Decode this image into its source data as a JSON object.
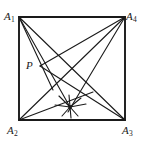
{
  "figure": {
    "kind": "geometry-diagram",
    "stroke_color": "#1a1a1a",
    "background_color": "#ffffff",
    "square_stroke_width": 1.9,
    "line_stroke_width": 1.1,
    "labels": {
      "a1": "A",
      "a1_sub": "1",
      "a2": "A",
      "a2_sub": "2",
      "a3": "A",
      "a3_sub": "3",
      "a4": "A",
      "a4_sub": "4",
      "p": "P"
    },
    "points": {
      "A1": {
        "x": 19,
        "y": 17,
        "name": "A1"
      },
      "A2": {
        "x": 19,
        "y": 120,
        "name": "A2"
      },
      "A3": {
        "x": 125,
        "y": 120,
        "name": "A3"
      },
      "A4": {
        "x": 125,
        "y": 17,
        "name": "A4"
      },
      "P": {
        "x": 40,
        "y": 66,
        "name": "P"
      },
      "S": {
        "x": 70,
        "y": 107,
        "name": "starburst-center"
      },
      "Q": {
        "x": 62,
        "y": 80,
        "name": "upper-crossing"
      }
    },
    "square_path": "M19,17 L125,17 L125,120 L19,120 Z",
    "segments": [
      {
        "name": "segment-A1-S",
        "x1": 19,
        "y1": 17,
        "x2": 70,
        "y2": 107
      },
      {
        "name": "segment-A1-A3",
        "x1": 19,
        "y1": 17,
        "x2": 125,
        "y2": 120
      },
      {
        "name": "segment-A1-P-ext",
        "x1": 19,
        "y1": 17,
        "x2": 53,
        "y2": 90
      },
      {
        "name": "segment-P-A4",
        "x1": 40,
        "y1": 66,
        "x2": 125,
        "y2": 17
      },
      {
        "name": "segment-P-A3",
        "x1": 40,
        "y1": 66,
        "x2": 125,
        "y2": 120
      },
      {
        "name": "segment-A4-A2",
        "x1": 125,
        "y1": 17,
        "x2": 19,
        "y2": 120
      },
      {
        "name": "segment-A4-S",
        "x1": 125,
        "y1": 17,
        "x2": 68,
        "y2": 112
      },
      {
        "name": "segment-A2-S-A3",
        "x1": 19,
        "y1": 120,
        "x2": 125,
        "y2": 120
      },
      {
        "name": "segment-A2-Q",
        "x1": 19,
        "y1": 120,
        "x2": 93,
        "y2": 92
      }
    ],
    "starburst_rays": [
      {
        "name": "ray-w",
        "x1": 55,
        "y1": 105,
        "x2": 70,
        "y2": 107
      },
      {
        "name": "ray-e",
        "x1": 70,
        "y1": 107,
        "x2": 86,
        "y2": 104
      },
      {
        "name": "ray-nw",
        "x1": 59,
        "y1": 96,
        "x2": 70,
        "y2": 107
      },
      {
        "name": "ray-ne",
        "x1": 70,
        "y1": 107,
        "x2": 81,
        "y2": 98
      },
      {
        "name": "ray-sw",
        "x1": 62,
        "y1": 116,
        "x2": 70,
        "y2": 107
      },
      {
        "name": "ray-se",
        "x1": 70,
        "y1": 107,
        "x2": 78,
        "y2": 116
      },
      {
        "name": "ray-n",
        "x1": 69,
        "y1": 95,
        "x2": 70,
        "y2": 107
      },
      {
        "name": "ray-s",
        "x1": 70,
        "y1": 107,
        "x2": 71,
        "y2": 118
      }
    ]
  }
}
